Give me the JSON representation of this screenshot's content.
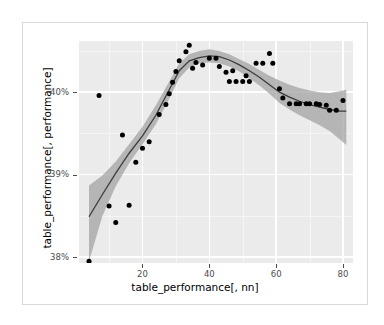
{
  "chart_data": {
    "type": "scatter",
    "title": "",
    "xlabel": "table_performance[, nn]",
    "ylabel": "table_performance[, performance]",
    "xlim": [
      1,
      83
    ],
    "ylim": [
      37.93,
      40.62
    ],
    "xticks": [
      20,
      40,
      60,
      80
    ],
    "xtick_labels": [
      "20",
      "40",
      "60",
      "80"
    ],
    "yticks": [
      38.0,
      39.0,
      40.0
    ],
    "ytick_labels": [
      "38%",
      "39%",
      "40%"
    ],
    "grid": true,
    "legend": false,
    "panel_background": "#ebebeb",
    "grid_color": "#ffffff",
    "point_color": "#000000",
    "line_color": "#3c3c3c",
    "band_color": "#9f9f9f",
    "series": [
      {
        "name": "observations",
        "type": "scatter",
        "x": [
          4,
          7,
          10,
          12,
          14,
          16,
          18,
          20,
          22,
          25,
          27,
          28,
          29,
          30,
          31,
          33,
          34,
          35,
          36,
          38,
          40,
          42,
          43,
          45,
          46,
          47,
          48,
          50,
          51,
          52,
          54,
          56,
          58,
          59,
          61,
          62,
          64,
          66,
          67,
          69,
          70,
          72,
          73,
          75,
          76,
          78,
          80
        ],
        "y": [
          37.95,
          39.96,
          38.62,
          38.42,
          39.48,
          38.63,
          39.15,
          39.32,
          39.4,
          39.73,
          39.85,
          39.98,
          40.12,
          40.25,
          40.38,
          40.49,
          40.57,
          40.29,
          40.36,
          40.33,
          40.41,
          40.41,
          40.31,
          40.24,
          40.13,
          40.26,
          40.13,
          40.13,
          40.2,
          40.13,
          40.35,
          40.35,
          40.47,
          40.35,
          40.04,
          39.93,
          39.86,
          39.86,
          39.86,
          39.86,
          39.86,
          39.86,
          39.85,
          39.84,
          39.78,
          39.78,
          39.9
        ]
      },
      {
        "name": "loess-smooth",
        "type": "line",
        "x": [
          4,
          8,
          12,
          16,
          20,
          24,
          28,
          31,
          34,
          37,
          40,
          43,
          46,
          49,
          52,
          55,
          58,
          61,
          64,
          67,
          70,
          73,
          76,
          79,
          81
        ],
        "y": [
          38.49,
          38.76,
          39.02,
          39.26,
          39.47,
          39.72,
          40.03,
          40.26,
          40.38,
          40.42,
          40.44,
          40.43,
          40.39,
          40.33,
          40.26,
          40.18,
          40.09,
          40.0,
          39.94,
          39.89,
          39.85,
          39.82,
          39.79,
          39.77,
          39.77
        ]
      },
      {
        "name": "confidence-band-upper",
        "type": "line",
        "x": [
          4,
          8,
          12,
          16,
          20,
          24,
          28,
          31,
          34,
          37,
          40,
          43,
          46,
          49,
          52,
          55,
          58,
          61,
          64,
          67,
          70,
          73,
          76,
          79,
          81
        ],
        "y": [
          38.87,
          38.99,
          39.16,
          39.37,
          39.58,
          39.84,
          40.13,
          40.35,
          40.46,
          40.5,
          40.52,
          40.5,
          40.46,
          40.4,
          40.34,
          40.27,
          40.2,
          40.14,
          40.09,
          40.05,
          40.02,
          40.0,
          39.99,
          40.01,
          40.03
        ]
      },
      {
        "name": "confidence-band-lower",
        "type": "line",
        "x": [
          4,
          8,
          12,
          16,
          20,
          24,
          28,
          31,
          34,
          37,
          40,
          43,
          46,
          49,
          52,
          55,
          58,
          61,
          64,
          67,
          70,
          73,
          76,
          79,
          81
        ],
        "y": [
          37.95,
          38.5,
          38.86,
          39.14,
          39.37,
          39.61,
          39.92,
          40.17,
          40.3,
          40.35,
          40.36,
          40.35,
          40.31,
          40.25,
          40.17,
          40.08,
          39.98,
          39.87,
          39.79,
          39.72,
          39.66,
          39.6,
          39.53,
          39.43,
          39.36
        ]
      }
    ]
  }
}
